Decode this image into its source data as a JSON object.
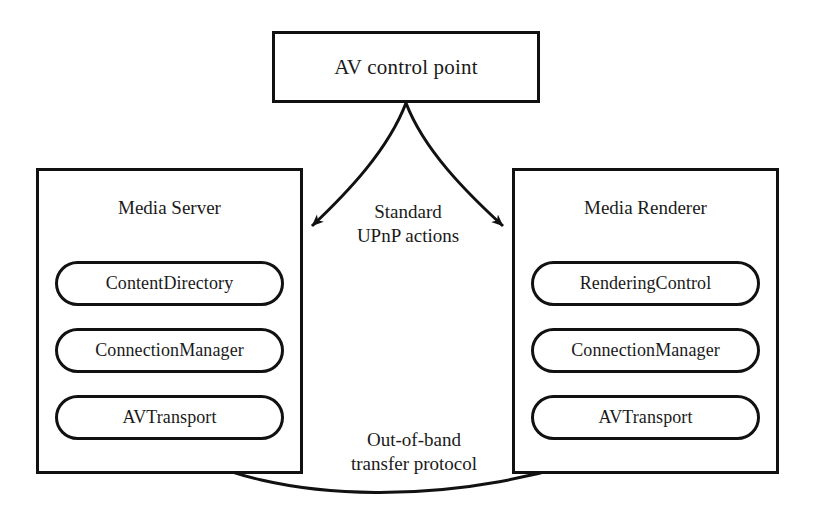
{
  "diagram": {
    "background_color": "#ffffff",
    "stroke_color": "#111111",
    "text_color": "#1a1a1a"
  },
  "control_point": {
    "label": "AV control point"
  },
  "devices": [
    {
      "id": "media-server",
      "title": "Media Server",
      "services": [
        {
          "label": "ContentDirectory"
        },
        {
          "label": "ConnectionManager"
        },
        {
          "label": "AVTransport"
        }
      ]
    },
    {
      "id": "media-renderer",
      "title": "Media Renderer",
      "services": [
        {
          "label": "RenderingControl"
        },
        {
          "label": "ConnectionManager"
        },
        {
          "label": "AVTransport"
        }
      ]
    }
  ],
  "edges": {
    "control_actions_label": "Standard\nUPnP actions",
    "transfer_label": "Out-of-band\ntransfer protocol"
  }
}
